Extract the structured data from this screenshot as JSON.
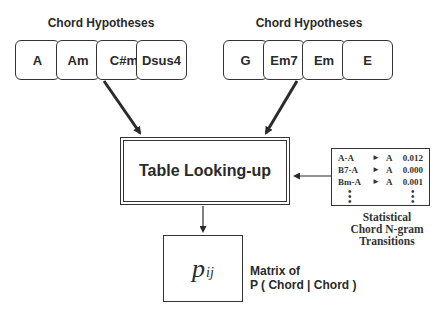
{
  "left_group": {
    "title": "Chord Hypotheses",
    "chords": [
      "A",
      "Am",
      "C#m",
      "Dsus4"
    ]
  },
  "right_group": {
    "title": "Chord Hypotheses",
    "chords": [
      "G",
      "Em7",
      "Em",
      "E"
    ]
  },
  "table_box": {
    "label": "Table Looking-up"
  },
  "stats_table": {
    "rows": [
      {
        "src": "A-A",
        "arrow": "►",
        "dst": "A",
        "value": "0.012"
      },
      {
        "src": "B7-A",
        "arrow": "►",
        "dst": "A",
        "value": "0.000"
      },
      {
        "src": "Bm-A",
        "arrow": "►",
        "dst": "A",
        "value": "0.001"
      }
    ],
    "caption_lines": [
      "Statistical",
      "Chord N-gram",
      "Transitions"
    ]
  },
  "output_box": {
    "symbol": "p",
    "subscript": "ij",
    "caption_lines": [
      "Matrix of",
      "P ( Chord | Chord )"
    ]
  },
  "colors": {
    "stroke": "#333333",
    "text": "#2a2a2a",
    "background": "#ffffff"
  }
}
